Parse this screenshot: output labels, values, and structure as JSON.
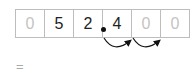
{
  "place_value_grid": {
    "cells": [
      {
        "digit": "0",
        "faint": true
      },
      {
        "digit": "5",
        "faint": false
      },
      {
        "digit": "2",
        "faint": false
      },
      {
        "digit": "4",
        "faint": false
      },
      {
        "digit": "0",
        "faint": true
      },
      {
        "digit": "0",
        "faint": true
      }
    ],
    "decimal_point_after_index": 2,
    "arrow_count": 2
  },
  "equals_sign": "="
}
